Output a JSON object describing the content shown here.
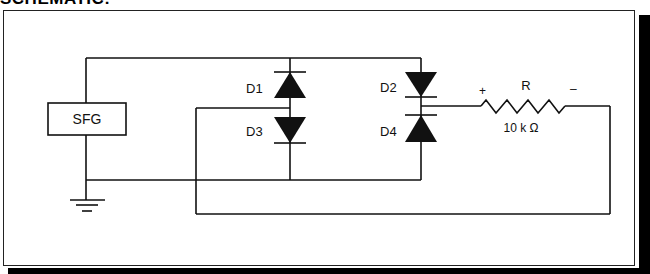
{
  "title": "SCHEMATIC:",
  "components": {
    "source": {
      "label": "SFG"
    },
    "diodes": [
      {
        "id": "d1",
        "label": "D1"
      },
      {
        "id": "d2",
        "label": "D2"
      },
      {
        "id": "d3",
        "label": "D3"
      },
      {
        "id": "d4",
        "label": "D4"
      }
    ],
    "resistor": {
      "label": "R",
      "value": "10 k Ω",
      "plus": "+",
      "minus": "–"
    }
  },
  "colors": {
    "ink": "#111111",
    "background": "#ffffff",
    "shadow": "#000000"
  }
}
